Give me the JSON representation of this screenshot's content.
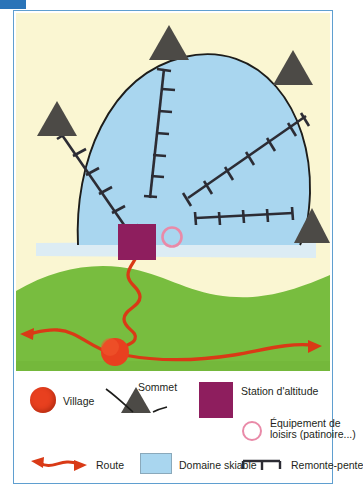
{
  "figure": {
    "kind": "schematic-map",
    "title_visible": false,
    "corner_tab_color": "#2a74b8",
    "frame_color": "#5f9fd0"
  },
  "map": {
    "name": "ski-resort-schematic-map",
    "background_color": "#faf6d2",
    "ski_area_color": "#a9d6ef",
    "valley_color": "#78bd3f",
    "road_color": "#d93a16",
    "summit_color": "#4c4a46",
    "station_color": "#8e1e5e",
    "village_color": "#e8401f",
    "leisure_ring_color": "#e98aa8",
    "lift_color": "#2c2c34",
    "summits_count": 4,
    "lifts_count": 4,
    "village_count": 1,
    "station_count": 1,
    "leisure_count": 1
  },
  "legend": {
    "name": "map-legend",
    "items": [
      {
        "key": "village",
        "label": "Village",
        "symbol": "filled-circle",
        "color": "#e8401f"
      },
      {
        "key": "sommet",
        "label": "Sommet",
        "symbol": "triangle",
        "color": "#4c4a46"
      },
      {
        "key": "station",
        "label": "Station d'altitude",
        "symbol": "filled-square",
        "color": "#8e1e5e"
      },
      {
        "key": "loisirs",
        "label": "Équipement de",
        "label2": "loisirs (patinoire...)",
        "symbol": "ring",
        "color": "#e98aa8"
      },
      {
        "key": "route",
        "label": "Route",
        "symbol": "double-arrow",
        "color": "#d93a16"
      },
      {
        "key": "skiable",
        "label": "Domaine skiable",
        "symbol": "filled-rect",
        "color": "#a9d6ef"
      },
      {
        "key": "remonte",
        "label": "Remonte-pente",
        "symbol": "lift-line",
        "color": "#2c2c34"
      }
    ]
  }
}
